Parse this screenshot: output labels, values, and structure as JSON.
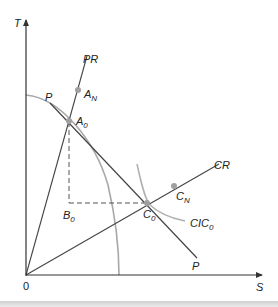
{
  "diagram": {
    "axes": {
      "y_label": "T",
      "x_label": "S",
      "origin_label": "0"
    },
    "lines": {
      "pr_label": "PR",
      "cr_label": "CR",
      "price_line_label_top": "P",
      "price_line_label_bottom": "P",
      "cic_label_main": "CIC",
      "cic_label_sub": "0"
    },
    "points": {
      "a0_main": "A",
      "a0_sub": "0",
      "an_main": "A",
      "an_sub": "N",
      "b0_main": "B",
      "b0_sub": "0",
      "c0_main": "C",
      "c0_sub": "0",
      "cn_main": "C",
      "cn_sub": "N"
    },
    "colors": {
      "axis": "#333333",
      "ray": "#444444",
      "ppf_curve": "#a8a8a8",
      "indifference_curve": "#b0b0b0",
      "point_marker": "#a0a0a0",
      "dashed": "#555555"
    }
  }
}
